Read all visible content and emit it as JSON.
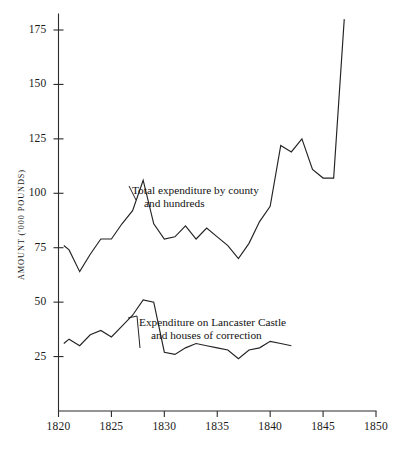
{
  "axes": {
    "y_title": "AMOUNT ('000 POUNDS)",
    "y_ticks": [
      25,
      50,
      75,
      100,
      125,
      150,
      175
    ],
    "x_ticks": [
      1820,
      1825,
      1830,
      1835,
      1840,
      1845,
      1850
    ]
  },
  "annotations": {
    "upper": {
      "line1": "Total expenditure by county",
      "line2": "and hundreds"
    },
    "lower": {
      "line1": "Expenditure on Lancaster Castle",
      "line2": "and houses of correction"
    }
  },
  "chart_data": {
    "type": "line",
    "title": "",
    "xlabel": "",
    "ylabel": "AMOUNT ('000 POUNDS)",
    "xlim": [
      1820,
      1850
    ],
    "ylim": [
      0,
      185
    ],
    "grid": false,
    "legend": "annotated-inline",
    "xticks": [
      1820,
      1825,
      1830,
      1835,
      1840,
      1845,
      1850
    ],
    "yticks": [
      25,
      50,
      75,
      100,
      125,
      150,
      175
    ],
    "series": [
      {
        "name": "Total expenditure by county and hundreds",
        "color": "#232323",
        "x": [
          1820.5,
          1821,
          1822,
          1823,
          1824,
          1825,
          1826,
          1827,
          1828,
          1829,
          1830,
          1831,
          1832,
          1833,
          1834,
          1835,
          1836,
          1837,
          1838,
          1839,
          1840,
          1841,
          1842,
          1843,
          1844,
          1845,
          1846,
          1847
        ],
        "values": [
          76,
          74,
          64,
          72,
          79,
          79,
          86,
          92,
          106,
          86,
          79,
          80,
          85,
          79,
          84,
          80,
          76,
          70,
          77,
          87,
          94,
          122,
          119,
          125,
          111,
          107,
          107,
          180
        ]
      },
      {
        "name": "Expenditure on Lancaster Castle and houses of correction",
        "color": "#232323",
        "x": [
          1820.5,
          1821,
          1822,
          1823,
          1824,
          1825,
          1826,
          1827,
          1828,
          1829,
          1830,
          1831,
          1832,
          1833,
          1834,
          1835,
          1836,
          1837,
          1838,
          1839,
          1840,
          1841,
          1842
        ],
        "values": [
          31,
          33,
          30,
          35,
          37,
          34,
          39,
          44,
          51,
          50,
          27,
          26,
          29,
          31,
          30,
          29,
          28,
          24,
          28,
          29,
          32,
          31,
          30
        ]
      }
    ]
  }
}
